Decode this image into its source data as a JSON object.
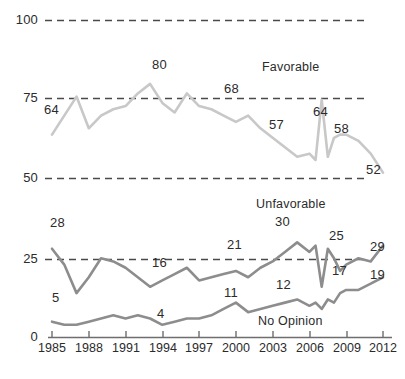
{
  "chart_data": {
    "type": "line",
    "title": "",
    "subtitle": "",
    "xlabel": "",
    "ylabel": "",
    "xlim": [
      1985,
      2012
    ],
    "ylim": [
      0,
      100
    ],
    "grid": true,
    "grid_style": "dashed-horizontal",
    "legend_position": "inline-annotations",
    "yticks": [
      "0",
      "25",
      "50",
      "75",
      "100"
    ],
    "ytick_values": [
      0,
      25,
      50,
      75,
      100
    ],
    "xticks": [
      "1985",
      "1988",
      "1991",
      "1994",
      "1997",
      "2000",
      "2003",
      "2006",
      "2009",
      "2012"
    ],
    "xtick_values": [
      1985,
      1988,
      1991,
      1994,
      1997,
      2000,
      2003,
      2006,
      2009,
      2012
    ],
    "colors": {
      "favorable": "#c8c8c8",
      "unfavorable": "#8d8d8d",
      "no_opinion": "#8d8d8d",
      "axis": "#6e6e6e",
      "grid": "#4a4a4a",
      "text": "#2b2b2b"
    },
    "series": [
      {
        "name": "Favorable",
        "color": "#c8c8c8",
        "x": [
          1985,
          1986,
          1987,
          1988,
          1989,
          1990,
          1991,
          1992,
          1993,
          1994,
          1995,
          1996,
          1997,
          1998,
          1999,
          2000,
          2001,
          2002,
          2003,
          2004,
          2005,
          2006,
          2006.5,
          2007,
          2007.5,
          2008,
          2008.5,
          2009,
          2010,
          2011,
          2012
        ],
        "values": [
          64,
          70,
          76,
          66,
          70,
          72,
          73,
          77,
          80,
          74,
          71,
          77,
          73,
          72,
          70,
          68,
          70,
          66,
          63,
          60,
          57,
          58,
          56,
          75,
          57,
          63,
          64,
          64,
          62,
          58,
          52
        ]
      },
      {
        "name": "Unfavorable",
        "color": "#8d8d8d",
        "x": [
          1985,
          1986,
          1987,
          1988,
          1989,
          1990,
          1991,
          1992,
          1993,
          1994,
          1995,
          1996,
          1997,
          1998,
          1999,
          2000,
          2001,
          2002,
          2003,
          2004,
          2005,
          2006,
          2006.5,
          2007,
          2007.5,
          2008,
          2008.5,
          2009,
          2010,
          2011,
          2012
        ],
        "values": [
          28,
          23,
          14,
          19,
          25,
          24,
          22,
          19,
          16,
          18,
          20,
          22,
          18,
          19,
          20,
          21,
          19,
          22,
          24,
          27,
          30,
          27,
          29,
          16,
          28,
          25,
          21,
          23,
          25,
          24,
          29
        ]
      },
      {
        "name": "No Opinion",
        "color": "#8d8d8d",
        "x": [
          1985,
          1986,
          1987,
          1988,
          1989,
          1990,
          1991,
          1992,
          1993,
          1994,
          1995,
          1996,
          1997,
          1998,
          1999,
          2000,
          2001,
          2002,
          2003,
          2004,
          2005,
          2006,
          2006.5,
          2007,
          2007.5,
          2008,
          2008.5,
          2009,
          2010,
          2011,
          2012
        ],
        "values": [
          5,
          4,
          4,
          5,
          6,
          7,
          6,
          7,
          6,
          4,
          5,
          6,
          6,
          7,
          9,
          11,
          8,
          9,
          10,
          11,
          12,
          10,
          11,
          9,
          12,
          11,
          14,
          15,
          15,
          17,
          19
        ]
      }
    ],
    "point_labels": [
      {
        "text": "64",
        "x": 1985,
        "value": 64,
        "series": "Favorable"
      },
      {
        "text": "80",
        "x": 1993,
        "value": 80,
        "series": "Favorable"
      },
      {
        "text": "68",
        "x": 2000,
        "value": 68,
        "series": "Favorable"
      },
      {
        "text": "57",
        "x": 2005,
        "value": 57,
        "series": "Favorable"
      },
      {
        "text": "64",
        "x": 2009,
        "value": 64,
        "series": "Favorable"
      },
      {
        "text": "58",
        "x": 2011,
        "value": 58,
        "series": "Favorable"
      },
      {
        "text": "52",
        "x": 2012,
        "value": 52,
        "series": "Favorable"
      },
      {
        "text": "28",
        "x": 1985,
        "value": 28,
        "series": "Unfavorable"
      },
      {
        "text": "16",
        "x": 1993,
        "value": 16,
        "series": "Unfavorable"
      },
      {
        "text": "21",
        "x": 2000,
        "value": 21,
        "series": "Unfavorable"
      },
      {
        "text": "30",
        "x": 2005,
        "value": 30,
        "series": "Unfavorable"
      },
      {
        "text": "25",
        "x": 2010,
        "value": 25,
        "series": "Unfavorable"
      },
      {
        "text": "29",
        "x": 2012,
        "value": 29,
        "series": "Unfavorable"
      },
      {
        "text": "5",
        "x": 1985,
        "value": 5,
        "series": "No Opinion"
      },
      {
        "text": "4",
        "x": 1994,
        "value": 4,
        "series": "No Opinion"
      },
      {
        "text": "11",
        "x": 2000,
        "value": 11,
        "series": "No Opinion"
      },
      {
        "text": "12",
        "x": 2005,
        "value": 12,
        "series": "No Opinion"
      },
      {
        "text": "17",
        "x": 2011,
        "value": 17,
        "series": "No Opinion"
      },
      {
        "text": "19",
        "x": 2012,
        "value": 19,
        "series": "No Opinion"
      }
    ],
    "annotations": [
      {
        "text": "Favorable",
        "series": "Favorable"
      },
      {
        "text": "Unfavorable",
        "series": "Unfavorable"
      },
      {
        "text": "No Opinion",
        "series": "No Opinion"
      }
    ]
  },
  "axis": {
    "y": {
      "t100": "100",
      "t75": "75",
      "t50": "50",
      "t25": "25",
      "t0": "0"
    },
    "x": {
      "t1985": "1985",
      "t1988": "1988",
      "t1991": "1991",
      "t1994": "1994",
      "t1997": "1997",
      "t2000": "2000",
      "t2003": "2003",
      "t2006": "2006",
      "t2009": "2009",
      "t2012": "2012"
    }
  },
  "labels": {
    "fav_64_left": "64",
    "fav_80": "80",
    "fav_68": "68",
    "fav_57": "57",
    "fav_64_right": "64",
    "fav_58": "58",
    "fav_52": "52",
    "unf_28": "28",
    "unf_16": "16",
    "unf_21": "21",
    "unf_30": "30",
    "unf_25": "25",
    "unf_29": "29",
    "noop_5": "5",
    "noop_4": "4",
    "noop_11": "11",
    "noop_12": "12",
    "noop_17": "17",
    "noop_19": "19",
    "series_favorable": "Favorable",
    "series_unfavorable": "Unfavorable",
    "series_no_opinion": "No Opinion"
  }
}
